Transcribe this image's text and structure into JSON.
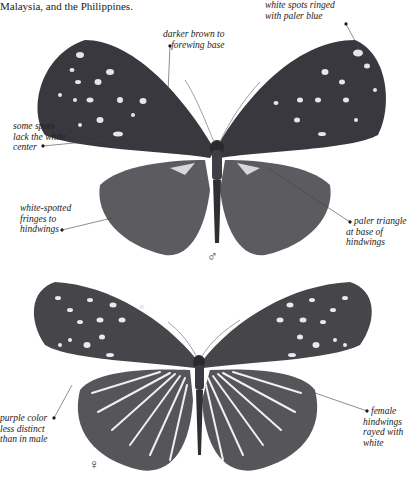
{
  "page": {
    "intro_text": "Malaysia, and the Philippines."
  },
  "male_figure": {
    "symbol": "♂",
    "annotations": {
      "spots_ringed": [
        "white spots ringed",
        "with paler blue"
      ],
      "darker_base": [
        "darker brown to",
        "forewing base"
      ],
      "lack_center": [
        "some spots",
        "lack the white",
        "center"
      ],
      "fringes": [
        "white-spotted",
        "fringes to",
        "hindwings"
      ],
      "paler_triangle": [
        "paler triangle",
        "at base of",
        "hindwings"
      ]
    }
  },
  "female_figure": {
    "symbol": "♀",
    "annotations": {
      "purple_color": [
        "purple color",
        "less distinct",
        "than in male"
      ],
      "rayed": [
        "female",
        "hindwings",
        "rayed with",
        "white"
      ]
    }
  },
  "colors": {
    "male_wing": "#3a3a40",
    "male_hindwing": "#5a5a5e",
    "female_wing": "#4a4a4e",
    "spot": "#e8e8ec",
    "text": "#222222"
  }
}
